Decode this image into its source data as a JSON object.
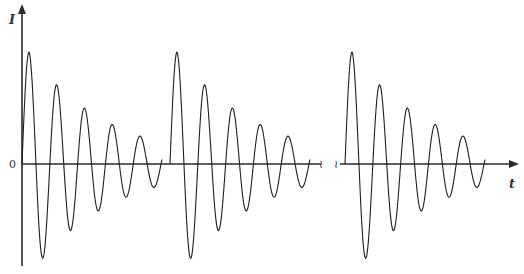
{
  "diagram": {
    "type": "damped-oscillation-bursts",
    "y_axis_label": "I",
    "x_axis_label": "t",
    "origin_label": "0",
    "axis_break_glyph": "≀",
    "colors": {
      "axis": "#2a2a2a",
      "wave": "#1e1e1e",
      "text": "#333333",
      "background": "#ffffff"
    },
    "bursts": [
      {
        "name": "burst-1",
        "start_x": 22,
        "end_x": 162
      },
      {
        "name": "burst-2",
        "start_x": 170,
        "end_x": 310
      },
      {
        "name": "burst-3",
        "start_x": 345,
        "end_x": 485
      }
    ],
    "wave_params": {
      "zero_y": 164,
      "amplitude_px": 112,
      "half_period_px": 13.9,
      "decay_per_px": 0.0125,
      "initial_offset_px": 7
    }
  },
  "chart_data": {
    "type": "line",
    "title": "",
    "xlabel": "t",
    "ylabel": "I",
    "bursts": 3,
    "peaks_per_burst": [
      {
        "sign": "+",
        "relative_amplitude": 1.0
      },
      {
        "sign": "-",
        "relative_amplitude": 0.8
      },
      {
        "sign": "+",
        "relative_amplitude": 0.6
      },
      {
        "sign": "-",
        "relative_amplitude": 0.48
      },
      {
        "sign": "+",
        "relative_amplitude": 0.36
      },
      {
        "sign": "-",
        "relative_amplitude": 0.3
      },
      {
        "sign": "+",
        "relative_amplitude": 0.21
      },
      {
        "sign": "-",
        "relative_amplitude": 0.19
      },
      {
        "sign": "+",
        "relative_amplitude": 0.12
      },
      {
        "sign": "-",
        "relative_amplitude": 0.11
      }
    ],
    "y_ticks": [
      "0"
    ],
    "grid": false,
    "legend": null
  }
}
